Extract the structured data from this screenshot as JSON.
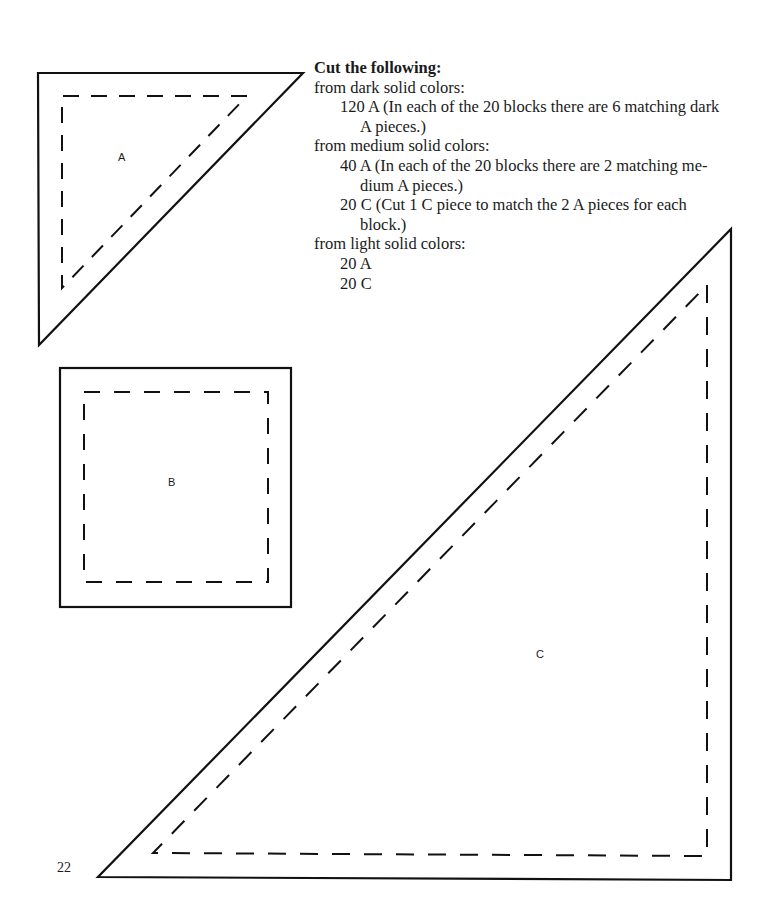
{
  "instructions": {
    "heading": "Cut the following:",
    "groups": [
      {
        "label": "from dark solid colors:",
        "items": [
          {
            "line1": "120 A (In each of the 20 blocks there are 6 matching dark",
            "line2": "A pieces.)"
          }
        ]
      },
      {
        "label": "from medium solid colors:",
        "items": [
          {
            "line1": "40 A (In each of the 20 blocks there are 2 matching me-",
            "line2": "dium A pieces.)"
          },
          {
            "line1": "20 C (Cut 1 C piece to match the 2 A pieces for each",
            "line2": "block.)"
          }
        ]
      },
      {
        "label": "from light solid colors:",
        "items": [
          {
            "line1": "20 A"
          },
          {
            "line1": "20 C"
          }
        ]
      }
    ]
  },
  "templates": {
    "a": {
      "label": "A",
      "shape": "triangle"
    },
    "b": {
      "label": "B",
      "shape": "square"
    },
    "c": {
      "label": "C",
      "shape": "triangle"
    }
  },
  "page_number": "22"
}
